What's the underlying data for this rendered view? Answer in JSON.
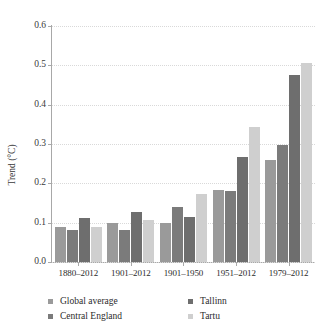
{
  "top_caption": "",
  "chart_data": {
    "type": "bar",
    "title": "",
    "subtitle": "",
    "xlabel": "",
    "ylabel": "Trend (°C)",
    "ylim": [
      0.0,
      0.6
    ],
    "ytick_labels": [
      "0.6",
      "0.5",
      "0.4",
      "0.3",
      "0.2",
      "0.1",
      "0.0"
    ],
    "ytick_values": [
      0.6,
      0.5,
      0.4,
      0.3,
      0.2,
      0.1,
      0.0
    ],
    "grid": "horizontal-dotted",
    "legend_position": "bottom",
    "categories": [
      "1880–2012",
      "1901–2012",
      "1901–1950",
      "1951–2012",
      "1979–2012"
    ],
    "series": [
      {
        "name": "Global average",
        "color": "#9a9a9a",
        "values": [
          0.09,
          0.099,
          0.099,
          0.183,
          0.26
        ]
      },
      {
        "name": "Central England",
        "color": "#7b7b7b",
        "values": [
          0.081,
          0.081,
          0.14,
          0.18,
          0.297
        ]
      },
      {
        "name": "Tallinn",
        "color": "#6e6e6e",
        "values": [
          0.111,
          0.128,
          0.114,
          0.268,
          0.475
        ]
      },
      {
        "name": "Tartu",
        "color": "#cfcfcf",
        "values": [
          0.089,
          0.108,
          0.173,
          0.342,
          0.505
        ]
      }
    ]
  }
}
